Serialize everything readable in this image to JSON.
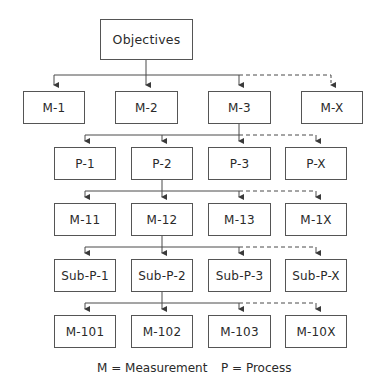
{
  "diagram": {
    "root": {
      "label": "Objectives"
    },
    "levels": [
      {
        "kind": "measurement",
        "nodes": [
          "M-1",
          "M-2",
          "M-3",
          "M-X"
        ],
        "expanded_index": 2
      },
      {
        "kind": "process",
        "nodes": [
          "P-1",
          "P-2",
          "P-3",
          "P-X"
        ],
        "expanded_index": 1
      },
      {
        "kind": "measurement",
        "nodes": [
          "M-11",
          "M-12",
          "M-13",
          "M-1X"
        ],
        "expanded_index": 1
      },
      {
        "kind": "sub-process",
        "nodes": [
          "Sub-P-1",
          "Sub-P-2",
          "Sub-P-3",
          "Sub-P-X"
        ],
        "expanded_index": 1
      },
      {
        "kind": "measurement",
        "nodes": [
          "M-101",
          "M-102",
          "M-103",
          "M-10X"
        ],
        "expanded_index": null
      }
    ],
    "edge_style": {
      "solid_to_first_three": true,
      "dashed_to_last": true
    }
  },
  "legend": {
    "m": "M = Measurement",
    "p": "P = Process"
  },
  "colors": {
    "line": "#4a4a4a",
    "box_border": "#555555",
    "text": "#2a2a2a",
    "background": "#ffffff"
  }
}
